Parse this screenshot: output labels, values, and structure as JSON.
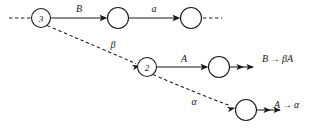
{
  "diagram": {
    "colors": {
      "stroke": "#1a1a1a",
      "background": "#ffffff",
      "node_fill": "#ffffff"
    },
    "nodes": [
      {
        "id": "n3",
        "label": "3",
        "cx": 41,
        "cy": 18,
        "r": 9.5
      },
      {
        "id": "t1",
        "label": "",
        "cx": 118,
        "cy": 18,
        "r": 10.5
      },
      {
        "id": "t2",
        "label": "",
        "cx": 191,
        "cy": 18,
        "r": 10.5
      },
      {
        "id": "n2",
        "label": "2",
        "cx": 147,
        "cy": 67,
        "r": 9.5
      },
      {
        "id": "m1",
        "label": "",
        "cx": 219,
        "cy": 67,
        "r": 10.5
      },
      {
        "id": "b1",
        "label": "",
        "cx": 246,
        "cy": 110,
        "r": 10.5
      }
    ],
    "edge_labels": [
      {
        "id": "lbl-B",
        "text": "B",
        "x": 79,
        "y": 8
      },
      {
        "id": "lbl-a",
        "text": "a",
        "x": 154,
        "y": 8
      },
      {
        "id": "lbl-beta",
        "text": "β",
        "x": 113,
        "y": 44
      },
      {
        "id": "lbl-A",
        "text": "A",
        "x": 184,
        "y": 58
      },
      {
        "id": "lbl-alpha",
        "text": "α",
        "x": 194,
        "y": 101
      }
    ],
    "productions": [
      {
        "id": "prod-B",
        "text": "B → βA",
        "x": 262,
        "y": 58
      },
      {
        "id": "prod-A",
        "text": "A → α",
        "x": 274,
        "y": 104
      }
    ]
  }
}
